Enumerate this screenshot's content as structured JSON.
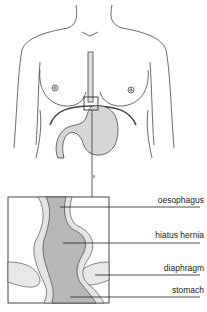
{
  "figure": {
    "labels": [
      {
        "id": "oesophagus",
        "text": "oesophagus"
      },
      {
        "id": "hiatus-hernia",
        "text": "hiatus hernia"
      },
      {
        "id": "diaphragm",
        "text": "diaphragm"
      },
      {
        "id": "stomach",
        "text": "stomach"
      }
    ]
  },
  "colors": {
    "line": "#333333",
    "organ_fill": "#d6d6d6",
    "inset_fill": "#b8b8b8",
    "wall_fill": "#e4e4e4"
  }
}
